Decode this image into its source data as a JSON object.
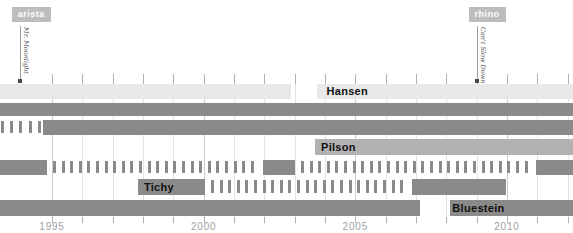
{
  "colors": {
    "bar_dark": "#8a8a8a",
    "bar_medium": "#b2b2b2",
    "bar_light": "#e8e8e8",
    "tag_bg": "#bdbdbd",
    "tag_text": "#ffffff",
    "track_label_text": "#111111",
    "axis_text": "#a0a0a0",
    "grid_minor": "#e3e3e3",
    "grid_major": "#cccccc",
    "grid_tick": "#b1b1b1",
    "annotation_line": "#9e9e9e",
    "annotation_dot": "#4a4a4a",
    "annotation_song_text": "#555555"
  },
  "annotations": [
    {
      "tag": "arista",
      "song": "Mr. Moonlight",
      "year": 1993.94
    },
    {
      "tag": "rhino",
      "song": "Can't Slow Down",
      "year": 2009.0
    }
  ],
  "axis": {
    "tick_labels": [
      "1995",
      "2000",
      "2005",
      "2010"
    ],
    "tick_years": [
      1995,
      2000,
      2005,
      2010
    ],
    "grid_start_year": 1995,
    "grid_end_year": 2012,
    "chart_start_year": 1993.3,
    "chart_end_year": 2012.2
  },
  "chart_data": {
    "type": "timeline",
    "title": "",
    "xlabel": "",
    "x_range": [
      1993.3,
      2012.2
    ],
    "x_ticks": [
      1995,
      2000,
      2005,
      2010
    ],
    "tracks": [
      {
        "id": "row-1",
        "label": "Hansen",
        "label_year": 2004.05,
        "style": "light",
        "segments": [
          {
            "kind": "bar",
            "start": 1993.3,
            "end": 2002.88
          },
          {
            "kind": "bar",
            "start": 2003.74,
            "end": 2012.2
          }
        ]
      },
      {
        "id": "row-2",
        "label": "",
        "style": "dark",
        "segments": [
          {
            "kind": "bar",
            "start": 1993.3,
            "end": 2012.2
          }
        ]
      },
      {
        "id": "row-3",
        "label": "",
        "style": "dark",
        "segments": [
          {
            "kind": "ticks",
            "start": 1993.32,
            "end": 1994.55,
            "period": 9.2
          },
          {
            "kind": "bar",
            "start": 1994.7,
            "end": 2012.2
          }
        ]
      },
      {
        "id": "row-4",
        "label": "Pilson",
        "label_year": 2003.87,
        "style": "medium",
        "segments": [
          {
            "kind": "bar",
            "start": 2003.67,
            "end": 2012.2
          }
        ]
      },
      {
        "id": "row-5",
        "label": "",
        "style": "dark",
        "segments": [
          {
            "kind": "bar",
            "start": 1993.3,
            "end": 1994.84
          },
          {
            "kind": "ticks",
            "start": 1995.03,
            "end": 2001.7
          },
          {
            "kind": "bar",
            "start": 2001.96,
            "end": 2003.01
          },
          {
            "kind": "ticks",
            "start": 2003.21,
            "end": 2010.7
          },
          {
            "kind": "bar",
            "start": 2010.96,
            "end": 2012.2
          }
        ]
      },
      {
        "id": "row-6",
        "label": "Tichy",
        "label_year": 1998.03,
        "style": "dark",
        "segments": [
          {
            "kind": "bar",
            "start": 1997.84,
            "end": 2000.04
          },
          {
            "kind": "ticks",
            "start": 2000.24,
            "end": 2006.65
          },
          {
            "kind": "bar",
            "start": 2006.87,
            "end": 2009.97
          }
        ]
      },
      {
        "id": "row-7",
        "label": "Bluestein",
        "label_year": 2008.2,
        "style": "dark",
        "segments": [
          {
            "kind": "bar",
            "start": 1993.3,
            "end": 2007.13
          },
          {
            "kind": "bar",
            "start": 2008.12,
            "end": 2012.2
          }
        ]
      }
    ]
  }
}
